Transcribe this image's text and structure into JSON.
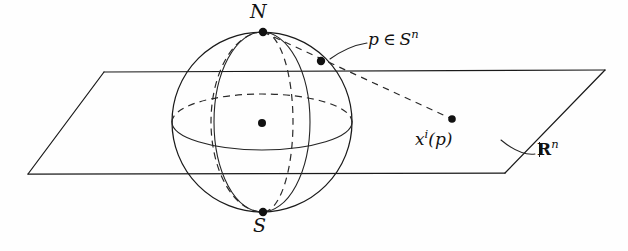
{
  "figure": {
    "background_color": "#fefefe",
    "ink_color": "#1a1a1a",
    "width": 628,
    "height": 251
  },
  "labels": {
    "north_pole": "N",
    "south_pole": "S",
    "point_on_sphere_p": "p",
    "point_on_sphere_member": "∈",
    "point_on_sphere_set": "S",
    "point_on_sphere_exponent": "n",
    "projected_point_base": "x",
    "projected_point_index": "i",
    "projected_point_arg": "(p)",
    "plane_symbol": "R",
    "plane_exponent": "n"
  },
  "geometry": {
    "sphere": {
      "center_x": 262,
      "center_y": 122,
      "radius": 90
    },
    "equator": {
      "semi_major": 90,
      "semi_minor": 28,
      "front_style": "solid",
      "back_style": "dashed"
    },
    "meridian_front": {
      "semi_major": 90,
      "semi_minor": 48,
      "style": "solid"
    },
    "meridian_back": {
      "semi_major": 90,
      "semi_minor": 30,
      "center_x": 294,
      "style": "dashed"
    },
    "plane": {
      "top_left_x": 104,
      "top_y": 72,
      "top_right_x": 605,
      "bottom_left_x": 28,
      "bottom_y": 174,
      "bottom_right_x": 505
    },
    "points": {
      "north": [
        263,
        32
      ],
      "south": [
        263,
        212
      ],
      "center": [
        262,
        123
      ],
      "p": [
        321,
        61
      ],
      "projection": [
        452,
        119
      ]
    },
    "ray": {
      "from": [
        263,
        32
      ],
      "through": [
        321,
        61
      ],
      "to": [
        452,
        119
      ],
      "style": "dashed"
    }
  }
}
